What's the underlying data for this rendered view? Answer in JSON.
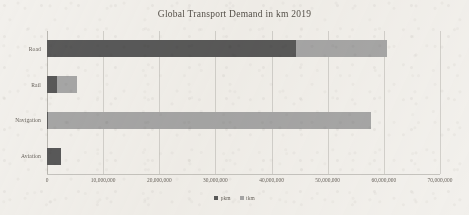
{
  "chart_data": {
    "type": "bar",
    "orientation": "horizontal",
    "stacked": true,
    "title": "Global Transport Demand in km 2019",
    "xlabel": "",
    "ylabel": "",
    "categories": [
      "Road",
      "Rail",
      "Navigation",
      "Aviation"
    ],
    "series": [
      {
        "name": "pkm",
        "color": "#595959",
        "values": [
          44300000,
          1800000,
          200000,
          2500000
        ]
      },
      {
        "name": "tkm",
        "color": "#a6a6a6",
        "values": [
          16300000,
          3500000,
          57600000,
          0
        ]
      }
    ],
    "xlim": [
      0,
      70000000
    ],
    "xtick_values": [
      0,
      10000000,
      20000000,
      30000000,
      40000000,
      50000000,
      60000000,
      70000000
    ],
    "xtick_labels": [
      "0",
      "10,000,000",
      "20,000,000",
      "30,000,000",
      "40,000,000",
      "50,000,000",
      "60,000,000",
      "70,000,000"
    ],
    "grid": true,
    "legend_position": "bottom"
  }
}
